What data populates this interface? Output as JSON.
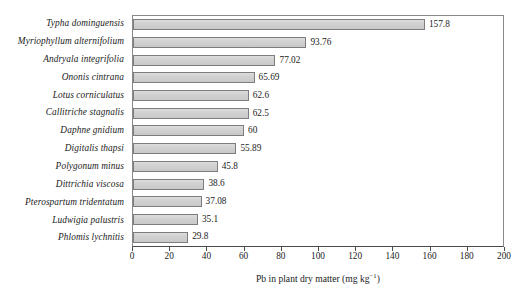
{
  "chart_data": {
    "type": "bar",
    "orientation": "horizontal",
    "title": "",
    "xlabel": "Pb in plant dry matter (mg kg⁻¹)",
    "ylabel": "",
    "xlim": [
      0,
      200
    ],
    "xticks": [
      0,
      20,
      40,
      60,
      80,
      100,
      120,
      140,
      160,
      180,
      200
    ],
    "xtick_labels": [
      "0",
      "20",
      "40",
      "60",
      "80",
      "100",
      "120",
      "140",
      "160",
      "180",
      "200"
    ],
    "grid": false,
    "legend": false,
    "bar_fill_color": "#d2d2d2",
    "bar_edge_color": "#7d7d7d",
    "categories": [
      "Typha dominguensis",
      "Myriophyllum alternifolium",
      "Andryala integrifolia",
      "Ononis cintrana",
      "Lotus corniculatus",
      "Callitriche stagnalis",
      "Daphne gnidium",
      "Digitalis thapsi",
      "Polygonum minus",
      "Dittrichia viscosa",
      "Pterospartum tridentatum",
      "Ludwigia palustris",
      "Phlomis lychnitis"
    ],
    "values": [
      157.8,
      93.76,
      77.02,
      65.69,
      62.6,
      62.5,
      60,
      55.89,
      45.8,
      38.6,
      37.08,
      35.1,
      29.8
    ],
    "value_labels": [
      "157.8",
      "93.76",
      "77.02",
      "65.69",
      "62.6",
      "62.5",
      "60",
      "55.89",
      "45.8",
      "38.6",
      "37.08",
      "35.1",
      "29.8"
    ],
    "axis_title_main": "Pb in plant dry matter (mg kg",
    "axis_title_sup": "−1",
    "axis_title_end": ")"
  }
}
